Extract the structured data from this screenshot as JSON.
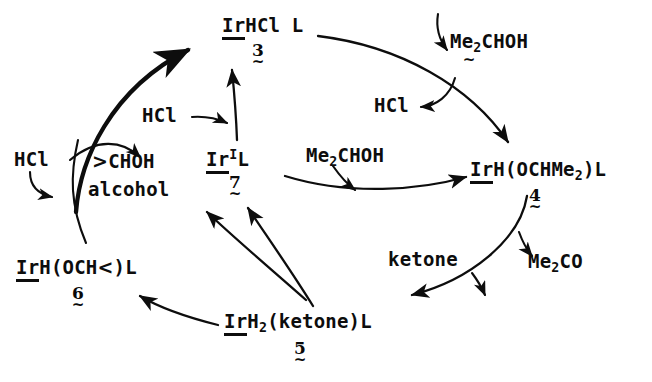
{
  "diagram": {
    "background_color": "#ffffff",
    "ink_color": "#0d0d0d"
  },
  "species": [
    {
      "id": "s3",
      "formula_html": "<span class=\"uline\">Ir</span>HCl L",
      "number": "3",
      "tilde": "~"
    },
    {
      "id": "s7",
      "formula_html": "<span class=\"uline\">Ir</span><sup>I</sup>L",
      "number": "7",
      "tilde": "~"
    },
    {
      "id": "s4",
      "formula_html": "<span class=\"uline\">Ir</span>H(OCHMe<sub>2</sub>)L",
      "number": "4",
      "tilde": "~"
    },
    {
      "id": "s6",
      "formula_html": "<span class=\"uline\">Ir</span>H(OCH<span class=\"angle\">&lt;</span>)L",
      "number": "6",
      "tilde": "~"
    },
    {
      "id": "s5",
      "formula_html": "<span class=\"uline\">Ir</span>H<sub>2</sub>(ketone)L",
      "number": "5",
      "tilde": "~"
    }
  ],
  "reagents": [
    {
      "id": "r_hcl_left",
      "text_html": "HCl"
    },
    {
      "id": "r_choh",
      "text_html": "<span class=\"angle\">&gt;</span>CHOH"
    },
    {
      "id": "r_alcohol",
      "text_html": "alcohol"
    },
    {
      "id": "r_hcl_mid",
      "text_html": "HCl"
    },
    {
      "id": "r_hcl_top",
      "text_html": "HCl"
    },
    {
      "id": "r_me2choh_top",
      "text_html": "Me<sub>2</sub>CHOH"
    },
    {
      "id": "r_me2choh_mid",
      "text_html": "Me<sub>2</sub>CHOH"
    },
    {
      "id": "r_me2co",
      "text_html": "Me<sub>2</sub>CO"
    },
    {
      "id": "r_ketone",
      "text_html": "ketone"
    }
  ],
  "labels": {
    "s3_formula": "IrHCl L",
    "s3_number": "3",
    "s7_formula": "Ir I L",
    "s7_number": "7",
    "s4_formula": "IrH(OCHMe2)L",
    "s4_number": "4",
    "s6_formula": "IrH(OCH<)L",
    "s6_number": "6",
    "s5_formula": "IrH2(ketone)L",
    "s5_number": "5",
    "hcl": "HCl",
    "choh": ">CHOH",
    "alcohol": "alcohol",
    "me2choh": "Me2CHOH",
    "me2co": "Me2CO",
    "ketone": "ketone",
    "tilde": "~"
  },
  "arrows": [
    {
      "id": "a_alcohol_to_3",
      "from": "alcohol-region",
      "to": "species-3",
      "style": "bold-curved"
    },
    {
      "id": "a_hcl_in_left",
      "from": "HCl",
      "to": "alcohol-region",
      "style": "small-hook"
    },
    {
      "id": "a_branch_choh",
      "from": "alcohol-region",
      "to": "CHOH",
      "style": "curved"
    },
    {
      "id": "a_7_to_3",
      "from": "species-7",
      "to": "species-3",
      "style": "straight-up"
    },
    {
      "id": "a_hcl_into_7_3",
      "from": "HCl",
      "to": "7-to-3-path",
      "style": "small-hook"
    },
    {
      "id": "a_3_to_4",
      "from": "species-3",
      "to": "species-4",
      "style": "long-curve"
    },
    {
      "id": "a_me2choh_in",
      "from": "Me2CHOH",
      "to": "3-to-4-path",
      "style": "small-hook"
    },
    {
      "id": "a_hcl_out_top",
      "from": "3-to-4-path",
      "to": "HCl",
      "style": "small-hook"
    },
    {
      "id": "a_7_to_4",
      "from": "species-7",
      "to": "species-4",
      "style": "curved-right"
    },
    {
      "id": "a_me2choh_in_mid",
      "from": "Me2CHOH",
      "to": "7-to-4-path",
      "style": "small-hook"
    },
    {
      "id": "a_4_to_5",
      "from": "species-4",
      "to": "species-5",
      "style": "long-curve-down"
    },
    {
      "id": "a_me2co_out",
      "from": "4-to-5-path",
      "to": "Me2CO",
      "style": "small-hook"
    },
    {
      "id": "a_ketone_in",
      "from": "ketone",
      "to": "4-to-5-path",
      "style": "small-hook"
    },
    {
      "id": "a_5_to_6",
      "from": "species-5",
      "to": "species-6",
      "style": "curved-left"
    },
    {
      "id": "a_5_to_alcohol",
      "from": "species-5",
      "to": "alcohol",
      "style": "straight"
    },
    {
      "id": "a_5_to_7",
      "from": "species-5",
      "to": "species-7",
      "style": "straight"
    }
  ]
}
